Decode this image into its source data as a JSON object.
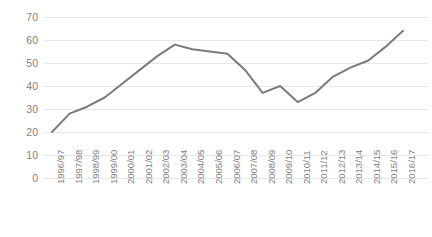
{
  "chart_data": {
    "type": "line",
    "title": "",
    "subtitle": "",
    "xlabel": "",
    "ylabel": "",
    "categories": [
      "1996/97",
      "1997/98",
      "1998/99",
      "1999/00",
      "2000/01",
      "2001/02",
      "2002/03",
      "2003/04",
      "2004/05",
      "2005/06",
      "2006/07",
      "2007/08",
      "2008/09",
      "2009/10",
      "2010/11",
      "2011/12",
      "2012/13",
      "2013/14",
      "2014/15",
      "2015/16",
      "2016/17"
    ],
    "values": [
      20,
      28,
      31,
      35,
      41,
      47,
      53,
      58,
      56,
      55,
      54,
      47,
      37,
      40,
      33,
      37,
      44,
      48,
      51,
      57,
      64
    ],
    "series": [
      {
        "name": "series-1",
        "values": [
          20,
          28,
          31,
          35,
          41,
          47,
          53,
          58,
          56,
          55,
          54,
          47,
          37,
          40,
          33,
          37,
          44,
          48,
          51,
          57,
          64
        ],
        "color": "#7b7b7b"
      }
    ],
    "ylim": [
      0,
      70
    ],
    "yticks": [
      0,
      10,
      20,
      30,
      40,
      50,
      60,
      70
    ],
    "ytick_labels": [
      "0",
      "10",
      "20",
      "30",
      "40",
      "50",
      "60",
      "70"
    ],
    "grid": true,
    "grid_axis": "y",
    "grid_color": "#e8e8e8",
    "legend": "none",
    "line_color": "#7b7b7b",
    "line_width": 2,
    "markers": "none",
    "background": "#ffffff",
    "tick_label_color": "#7f7f7f"
  }
}
